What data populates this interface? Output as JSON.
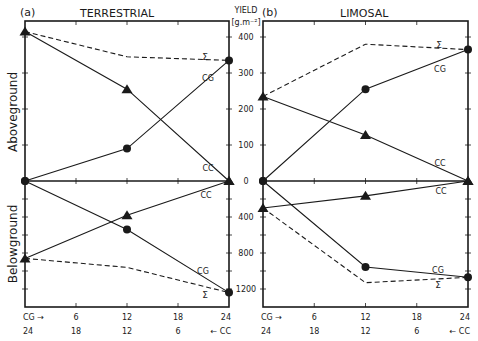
{
  "figure": {
    "panels": [
      {
        "tag": "(a)",
        "title": "TERRESTRIAL"
      },
      {
        "tag": "(b)",
        "title": "LIMOSAL"
      }
    ],
    "yaxis_title_line1": "YIELD",
    "yaxis_title_line2": "[g.m⁻²]",
    "side_labels": {
      "above": "Aboveground",
      "below": "Belowground"
    },
    "x_labels_row1": [
      "CG →",
      "6",
      "12",
      "18",
      "24"
    ],
    "x_labels_row2": [
      "24",
      "18",
      "12",
      "6",
      "← CC"
    ],
    "series_labels": {
      "cg": "CG",
      "cc": "CC",
      "sigma": "Σ"
    }
  },
  "chart_data": [
    {
      "type": "line",
      "title": "(a) TERRESTRIAL",
      "x": [
        0,
        12,
        24
      ],
      "x_secondary": [
        24,
        12,
        0
      ],
      "xlabel": "CG → / ← CC",
      "ylabel": "YIELD [g.m-2]",
      "aboveground": {
        "ylim": [
          0,
          420
        ],
        "yticks": [
          0,
          100,
          200,
          300,
          400
        ],
        "series": [
          {
            "name": "CG",
            "marker": "circle",
            "values": [
              0,
              90,
              335
            ]
          },
          {
            "name": "CC",
            "marker": "triangle",
            "values": [
              415,
              255,
              0
            ]
          },
          {
            "name": "Σ",
            "style": "dashed",
            "values": [
              415,
              345,
              335
            ]
          }
        ]
      },
      "belowground": {
        "ylim": [
          0,
          1400
        ],
        "yticks": [
          0,
          400,
          800,
          1200
        ],
        "inverted": true,
        "series": [
          {
            "name": "CG",
            "marker": "circle",
            "values": [
              0,
              540,
              1240
            ]
          },
          {
            "name": "CC",
            "marker": "triangle",
            "values": [
              860,
              380,
              0
            ]
          },
          {
            "name": "Σ",
            "style": "dashed",
            "values": [
              860,
              960,
              1240
            ]
          }
        ]
      }
    },
    {
      "type": "line",
      "title": "(b) LIMOSAL",
      "x": [
        0,
        12,
        24
      ],
      "x_secondary": [
        24,
        12,
        0
      ],
      "xlabel": "CG → / ← CC",
      "ylabel": "YIELD [g.m-2]",
      "aboveground": {
        "ylim": [
          0,
          420
        ],
        "yticks": [
          0,
          100,
          200,
          300,
          400
        ],
        "series": [
          {
            "name": "CG",
            "marker": "circle",
            "values": [
              0,
              255,
              365
            ]
          },
          {
            "name": "CC",
            "marker": "triangle",
            "values": [
              235,
              128,
              0
            ]
          },
          {
            "name": "Σ",
            "style": "dashed",
            "values": [
              235,
              380,
              365
            ]
          }
        ]
      },
      "belowground": {
        "ylim": [
          0,
          1400
        ],
        "yticks": [
          0,
          400,
          800,
          1200
        ],
        "inverted": true,
        "series": [
          {
            "name": "CG",
            "marker": "circle",
            "values": [
              0,
              955,
              1070
            ]
          },
          {
            "name": "CC",
            "marker": "triangle",
            "values": [
              300,
              165,
              0
            ]
          },
          {
            "name": "Σ",
            "style": "dashed",
            "values": [
              300,
              1130,
              1070
            ]
          }
        ]
      }
    }
  ]
}
